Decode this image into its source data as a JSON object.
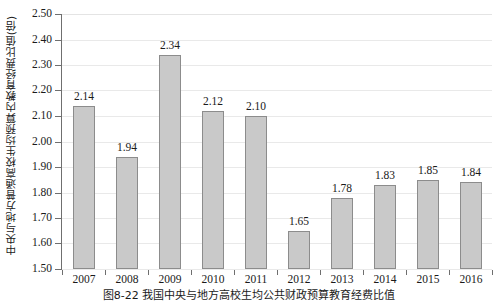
{
  "chart_data": {
    "type": "bar",
    "title": "",
    "caption": "图8-22  我国中央与地方高校生均公共财政预算教育经费比值",
    "xlabel": "",
    "ylabel": "中央与地方普通高校生均预算内教育经费比值(倍)",
    "categories": [
      "2007",
      "2008",
      "2009",
      "2010",
      "2011",
      "2012",
      "2013",
      "2014",
      "2015",
      "2016"
    ],
    "values": [
      2.14,
      1.94,
      2.34,
      2.12,
      2.1,
      1.65,
      1.78,
      1.83,
      1.85,
      1.84
    ],
    "value_labels": [
      "2.14",
      "1.94",
      "2.34",
      "2.12",
      "2.10",
      "1.65",
      "1.78",
      "1.83",
      "1.85",
      "1.84"
    ],
    "ylim": [
      1.5,
      2.5
    ],
    "ytick_labels": [
      "2.50",
      "2.40",
      "2.30",
      "2.20",
      "2.10",
      "2.00",
      "1.90",
      "1.80",
      "1.70",
      "1.60",
      "1.50"
    ],
    "ytick_values": [
      2.5,
      2.4,
      2.3,
      2.2,
      2.1,
      2.0,
      1.9,
      1.8,
      1.7,
      1.6,
      1.5
    ],
    "grid": true,
    "legend": "none",
    "series_color": "#c9c9c9",
    "series_border_color": "#8c8c8c",
    "grid_color": "#e9e9e9",
    "axis_color": "#6f6f6f"
  }
}
